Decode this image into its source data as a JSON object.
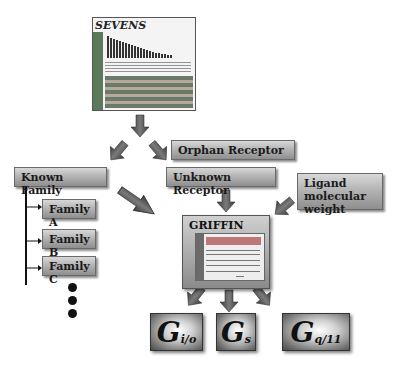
{
  "diagram": {
    "screenshot": {
      "title": "SEVENS"
    },
    "nodes": {
      "orphan_receptor": "Orphan Receptor",
      "known_family": "Known Family",
      "unknown_receptor": "Unknown Receptor",
      "ligand": "Ligand molecular weight",
      "griffin": "GRIFFIN",
      "families": [
        "Family A",
        "Family B",
        "Family C"
      ]
    },
    "outputs": [
      {
        "main": "G",
        "sub": "i/o"
      },
      {
        "main": "G",
        "sub": "s"
      },
      {
        "main": "G",
        "sub": "q/11"
      }
    ],
    "colors": {
      "box_gradient_top": "#d8d8d8",
      "box_gradient_bottom": "#8e8e8e",
      "arrow": "#555555"
    }
  }
}
